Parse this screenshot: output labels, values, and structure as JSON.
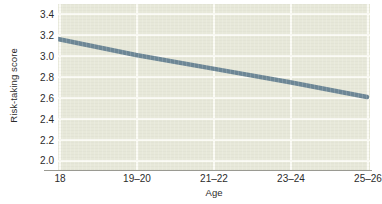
{
  "chart_data": {
    "type": "line",
    "title": "",
    "xlabel": "Age",
    "ylabel": "Risk-taking score",
    "categories": [
      "18",
      "19–20",
      "21–22",
      "23–24",
      "25–26"
    ],
    "values": [
      3.15,
      3.0,
      2.87,
      2.74,
      2.6
    ],
    "series": [
      {
        "name": "Risk-taking score",
        "values": [
          3.15,
          3.0,
          2.87,
          2.74,
          2.6
        ]
      }
    ],
    "ylim": [
      2.0,
      3.5
    ],
    "yticks": [
      "3.4",
      "3.2",
      "3.0",
      "2.8",
      "2.6",
      "2.4",
      "2.2",
      "2.0"
    ],
    "ytick_values": [
      3.4,
      3.2,
      3.0,
      2.8,
      2.6,
      2.4,
      2.2,
      2.0
    ],
    "xticks": [
      "18",
      "19–20",
      "21–22",
      "23–24",
      "25–26"
    ],
    "grid": true,
    "legend": "none",
    "colors": {
      "line": "#6d8796",
      "panel_background": "#e7e8d9",
      "gridline": "#fbfbf5",
      "axis": "#9a9a92",
      "text": "#2b2b2b",
      "figure_background": "#ffffff"
    },
    "line_width_px": 4
  }
}
